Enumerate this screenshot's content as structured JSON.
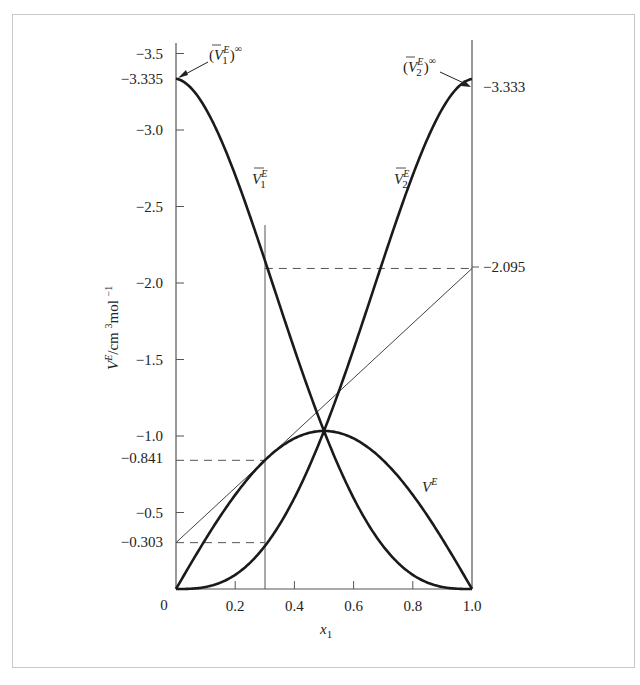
{
  "chart_data": {
    "type": "line",
    "title": "",
    "xlabel": "x1",
    "ylabel": "V^E/cm^3 mol^-1",
    "xlim": [
      0,
      1.0
    ],
    "ylim": [
      0,
      -3.5
    ],
    "y_axis_inverted": true,
    "grid": false,
    "x_ticks": [
      0,
      0.2,
      0.4,
      0.6,
      0.8,
      1.0
    ],
    "x_tick_labels": [
      "0",
      "0.2",
      "0.4",
      "0.6",
      "0.8",
      "1.0"
    ],
    "y_ticks": [
      -0.5,
      -1.0,
      -1.5,
      -2.0,
      -2.5,
      -3.0,
      -3.5
    ],
    "y_tick_labels": [
      "−0.5",
      "−1.0",
      "−1.5",
      "−2.0",
      "−2.5",
      "−3.0",
      "−3.5"
    ],
    "x": [
      0.0,
      0.1,
      0.2,
      0.3,
      0.4,
      0.5,
      0.6,
      0.7,
      0.8,
      0.9,
      1.0
    ],
    "series": [
      {
        "name": "V^E",
        "values": [
          0.0,
          -0.326,
          -0.615,
          -0.841,
          -0.984,
          -1.033,
          -0.984,
          -0.841,
          -0.615,
          -0.326,
          0.0
        ]
      },
      {
        "name": "V̄1^E",
        "values": [
          -3.335,
          -3.14,
          -2.705,
          -2.095,
          -1.568,
          -1.033,
          -0.595,
          -0.303,
          -0.092,
          -0.013,
          0.0
        ]
      },
      {
        "name": "V̄2^E",
        "values": [
          0.0,
          -0.013,
          -0.092,
          -0.303,
          -0.595,
          -1.033,
          -1.568,
          -2.095,
          -2.705,
          -3.14,
          -3.333
        ]
      },
      {
        "name": "tangent at x1=0.3",
        "values": [
          -0.303,
          -2.095
        ],
        "x": [
          0.0,
          1.0
        ]
      }
    ],
    "annotations": [
      {
        "text": "(V̄1^E)^∞",
        "value": -3.335,
        "at_x": 0.0
      },
      {
        "text": "(V̄2^E)^∞",
        "value": -3.333,
        "at_x": 1.0
      },
      {
        "text": "−0.841",
        "value": -0.841,
        "type": "dashed-hline"
      },
      {
        "text": "−0.303",
        "value": -0.303,
        "type": "dashed-hline"
      },
      {
        "text": "−2.095",
        "value": -2.095,
        "type": "dashed-hline"
      },
      {
        "text": "x1 = 0.3",
        "value": 0.3,
        "type": "vline"
      }
    ],
    "model": {
      "form": "x1*x2*(a + b*(x1-x2) + c*(x1-x2)^2)",
      "a": -4.132,
      "b": 0.001,
      "c": 0.798
    }
  },
  "labels": {
    "y_axis_main": "V",
    "y_axis_sup": "E",
    "y_axis_unit": "/cm ",
    "y_axis_unit_sup": "3",
    "y_axis_unit2": "mol ",
    "y_axis_unit2_sup": "−1",
    "x_axis_main": "x",
    "x_axis_sub": "1",
    "left_special": [
      "−3.335",
      "−0.841",
      "−0.303"
    ],
    "right_special": [
      "−3.333",
      "−2.095"
    ],
    "origin": "0",
    "curve_v1_main": "V",
    "curve_v1_sup": "E",
    "curve_v1_sub": "1",
    "curve_v2_main": "V",
    "curve_v2_sup": "E",
    "curve_v2_sub": "2",
    "curve_ve_main": "V",
    "curve_ve_sup": "E",
    "inf1_open": "(",
    "inf1_main": "V",
    "inf1_sup": "E",
    "inf1_sub": "1",
    "inf1_close": ")",
    "inf1_inf": "∞",
    "inf2_open": "(",
    "inf2_main": "V",
    "inf2_sup": "E",
    "inf2_sub": "2",
    "inf2_close": ")",
    "inf2_inf": "∞"
  },
  "colors": {
    "curve": "#1a1a1a",
    "axis": "#555555",
    "frame": "#c8c8c8",
    "text": "#222222"
  }
}
